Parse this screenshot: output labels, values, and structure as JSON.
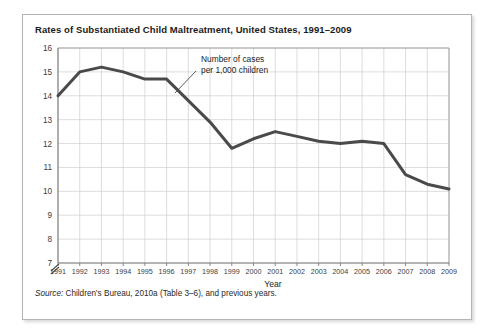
{
  "figure": {
    "title": "Rates of Substantiated Child Maltreatment, United States, 1991–2009",
    "source_lead": "Source:",
    "source_text": " Children's Bureau, 2010a (Table 3–6), and previous years.",
    "border_color": "#b4b4b4",
    "background": "#ffffff"
  },
  "chart_data": {
    "type": "line",
    "title": "Rates of Substantiated Child Maltreatment, United States, 1991–2009",
    "xlabel": "Year",
    "ylabel": "",
    "categories": [
      "1991",
      "1992",
      "1993",
      "1994",
      "1995",
      "1996",
      "1997",
      "1998",
      "1999",
      "2000",
      "2001",
      "2002",
      "2003",
      "2004",
      "2005",
      "2006",
      "2007",
      "2008",
      "2009"
    ],
    "values": [
      14.0,
      15.0,
      15.2,
      15.0,
      14.7,
      14.7,
      13.8,
      12.9,
      11.8,
      12.2,
      12.5,
      12.3,
      12.1,
      12.0,
      12.1,
      12.0,
      10.7,
      10.3,
      10.1
    ],
    "series": [
      {
        "name": "Number of cases per 1,000 children",
        "values": [
          14.0,
          15.0,
          15.2,
          15.0,
          14.7,
          14.7,
          13.8,
          12.9,
          11.8,
          12.2,
          12.5,
          12.3,
          12.1,
          12.0,
          12.1,
          12.0,
          10.7,
          10.3,
          10.1
        ],
        "color": "#4a4a4a"
      }
    ],
    "ylim": [
      7,
      16
    ],
    "yticks": [
      7,
      8,
      9,
      10,
      11,
      12,
      13,
      14,
      15,
      16
    ],
    "ytick_labels": [
      "7",
      "8",
      "9",
      "10",
      "11",
      "12",
      "13",
      "14",
      "15",
      "16"
    ],
    "xtick_labels": [
      "1991",
      "1992",
      "1993",
      "1994",
      "1995",
      "1996",
      "1997",
      "1998",
      "1999",
      "2000",
      "2001",
      "2002",
      "2003",
      "2004",
      "2005",
      "2006",
      "2007",
      "2008",
      "2009"
    ],
    "grid": true,
    "grid_color": "#cfcfcf",
    "axis_break": true,
    "axis_break_note": "y-axis break below 7",
    "legend": "none",
    "annotations": [
      {
        "id": "series-callout",
        "line1": "Number of cases",
        "line2": "per 1,000 children",
        "leader_line": true
      }
    ]
  }
}
